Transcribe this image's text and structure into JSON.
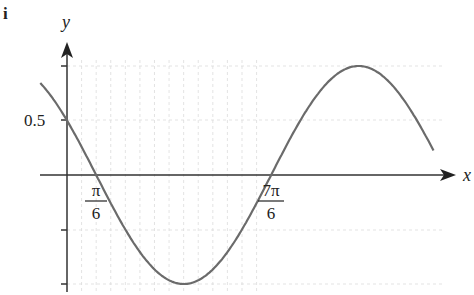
{
  "part_label": "i",
  "chart_data": {
    "type": "line",
    "title": "",
    "function": "y = cos(x + π/3)",
    "xlabel": "x",
    "ylabel": "y",
    "y_ticks": [
      1,
      0.5,
      -0.5,
      -1
    ],
    "y_tick_labels": {
      "0.5": "0.5"
    },
    "x_tick_labels": [
      {
        "value": 0.5236,
        "num": "π",
        "den": "6"
      },
      {
        "value": 3.6652,
        "num": "7π",
        "den": "6"
      }
    ],
    "xlim": [
      -0.48,
      6.58
    ],
    "ylim": [
      -1.1,
      1.1
    ],
    "grid": true,
    "key_points": [
      {
        "x": 0,
        "y": 0.5
      },
      {
        "x": 0.5236,
        "y": 0
      },
      {
        "x": 2.0944,
        "y": -1
      },
      {
        "x": 3.6652,
        "y": 0
      },
      {
        "x": 5.236,
        "y": 1
      }
    ]
  },
  "colors": {
    "curve": "#6b6b6b",
    "axis": "#333333",
    "grid": "#dcdcdc"
  }
}
